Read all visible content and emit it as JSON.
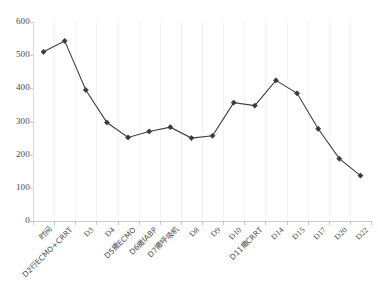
{
  "chart_data": {
    "type": "line",
    "title": "",
    "subtitle": "",
    "xlabel": "",
    "ylabel": "",
    "ylim": [
      0,
      600
    ],
    "ytick_step": 100,
    "yticks": [
      "0",
      "100",
      "200",
      "300",
      "400",
      "500",
      "600"
    ],
    "grid": "vertical",
    "legend": "none",
    "series_name": "",
    "line_color": "#3f3f3f",
    "marker_color": "#3a3a3a",
    "marker_shape": "diamond",
    "categories": [
      "时间",
      "D2行ECMO+CRRT",
      "D3",
      "D4",
      "D5撤ECMO",
      "D6撤IABP",
      "D7撤呼吸机",
      "D8",
      "D9",
      "D10",
      "D11撤CRRT",
      "D14",
      "D15",
      "D17",
      "D20",
      "D22"
    ],
    "values": [
      510,
      543,
      395,
      297,
      252,
      270,
      283,
      250,
      257,
      357,
      348,
      424,
      385,
      278,
      188,
      137
    ],
    "points": [
      {
        "x": "时间",
        "y": 510
      },
      {
        "x": "D2行ECMO+CRRT",
        "y": 543
      },
      {
        "x": "D3",
        "y": 395
      },
      {
        "x": "D4",
        "y": 297
      },
      {
        "x": "D5撤ECMO",
        "y": 252
      },
      {
        "x": "D6撤IABP",
        "y": 270
      },
      {
        "x": "D7撤呼吸机",
        "y": 283
      },
      {
        "x": "D8",
        "y": 250
      },
      {
        "x": "D9",
        "y": 257
      },
      {
        "x": "D10",
        "y": 357
      },
      {
        "x": "D11撤CRRT",
        "y": 348
      },
      {
        "x": "D14",
        "y": 424
      },
      {
        "x": "D15",
        "y": 385
      },
      {
        "x": "D17",
        "y": 278
      },
      {
        "x": "D20",
        "y": 188
      },
      {
        "x": "D22",
        "y": 137
      }
    ]
  }
}
